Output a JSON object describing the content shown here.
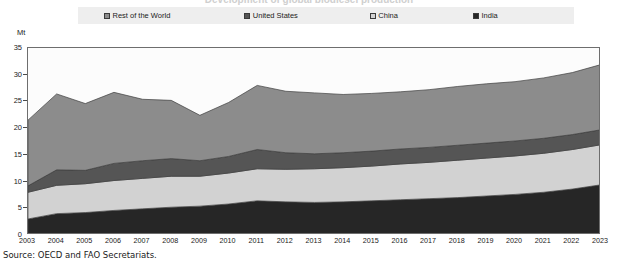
{
  "chart_title": "Development of global biodiesel production",
  "unit_label": "Mt",
  "source_note": "Source:  OECD and FAO Secretariats.",
  "legend": {
    "items": [
      {
        "label": "Rest of the World",
        "color": "#8c8c8c"
      },
      {
        "label": "United States",
        "color": "#555555"
      },
      {
        "label": "China",
        "color": "#d2d2d2"
      },
      {
        "label": "India",
        "color": "#262626"
      }
    ]
  },
  "axes": {
    "y_ticks": [
      0,
      5,
      10,
      15,
      20,
      25,
      30,
      35
    ],
    "y_min": 0,
    "y_max": 35,
    "x_ticks": [
      "2003",
      "2004",
      "2005",
      "2006",
      "2007",
      "2008",
      "2009",
      "2010",
      "2011",
      "2012",
      "2013",
      "2014",
      "2015",
      "2016",
      "2017",
      "2018",
      "2019",
      "2020",
      "2021",
      "2022",
      "2023"
    ]
  },
  "chart_data": {
    "type": "area",
    "stacked": true,
    "title": "",
    "xlabel": "",
    "ylabel": "Mt",
    "ylim": [
      0,
      35
    ],
    "grid": false,
    "legend_position": "top",
    "categories": [
      2003,
      2004,
      2005,
      2006,
      2007,
      2008,
      2009,
      2010,
      2011,
      2012,
      2013,
      2014,
      2015,
      2016,
      2017,
      2018,
      2019,
      2020,
      2021,
      2022,
      2023
    ],
    "stack_order_bottom_to_top": [
      "India",
      "China",
      "United States",
      "Rest of the World"
    ],
    "series": [
      {
        "name": "India",
        "color": "#262626",
        "values": [
          3.0,
          4.0,
          4.2,
          4.6,
          4.9,
          5.2,
          5.4,
          5.8,
          6.4,
          6.2,
          6.1,
          6.2,
          6.4,
          6.6,
          6.8,
          7.0,
          7.3,
          7.6,
          8.0,
          8.6,
          9.4
        ]
      },
      {
        "name": "China",
        "color": "#d2d2d2",
        "values": [
          5.0,
          5.3,
          5.4,
          5.6,
          5.7,
          5.8,
          5.6,
          5.8,
          6.0,
          6.1,
          6.3,
          6.4,
          6.5,
          6.7,
          6.8,
          7.0,
          7.1,
          7.2,
          7.3,
          7.4,
          7.5
        ]
      },
      {
        "name": "United States",
        "color": "#555555",
        "values": [
          1.2,
          2.9,
          2.5,
          3.2,
          3.3,
          3.3,
          2.9,
          3.1,
          3.6,
          3.1,
          2.8,
          2.8,
          2.8,
          2.8,
          2.8,
          2.8,
          2.8,
          2.8,
          2.8,
          2.8,
          2.8
        ]
      },
      {
        "name": "Rest of the World",
        "color": "#8c8c8c",
        "values": [
          12.3,
          14.2,
          12.5,
          13.3,
          11.5,
          10.9,
          8.5,
          10.1,
          12.0,
          11.5,
          11.4,
          10.9,
          10.8,
          10.7,
          10.8,
          11.0,
          11.1,
          11.1,
          11.3,
          11.6,
          12.2
        ]
      }
    ],
    "totals": [
      21.5,
      26.4,
      24.6,
      26.7,
      25.4,
      25.2,
      22.4,
      24.8,
      28.0,
      26.9,
      26.6,
      26.3,
      26.5,
      26.8,
      27.2,
      27.8,
      28.3,
      28.7,
      29.4,
      30.4,
      31.9
    ]
  }
}
